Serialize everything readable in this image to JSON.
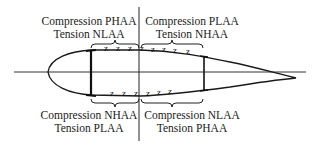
{
  "diagram": {
    "labels": {
      "upper_forward": {
        "line1": "Compression PHAA",
        "line2": "Tension NLAA"
      },
      "upper_aft": {
        "line1": "Compression PLAA",
        "line2": "Tension NHAA"
      },
      "lower_forward": {
        "line1": "Compression NHAA",
        "line2": "Tension PLAA"
      },
      "lower_aft": {
        "line1": "Compression NLAA",
        "line2": "Tension PHAA"
      }
    },
    "components": [
      "airfoil-outline",
      "chord-line",
      "vertical-divider",
      "front-spar",
      "rear-spar",
      "upper-skin-buckles",
      "lower-skin-buckles",
      "region-braces"
    ],
    "buckle_glyph": "z",
    "colors": {
      "stroke": "#1a1a1a",
      "background": "#ffffff"
    }
  }
}
